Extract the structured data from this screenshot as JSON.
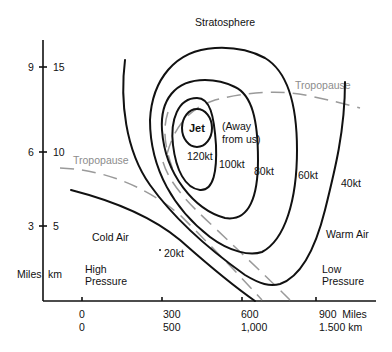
{
  "title": "Stratosphere",
  "y_axis": {
    "unit_miles": "Miles",
    "unit_km": "km",
    "ticks": [
      {
        "miles": "9",
        "km": "15"
      },
      {
        "miles": "6",
        "km": "10"
      },
      {
        "miles": "3",
        "km": "5"
      }
    ]
  },
  "x_axis": {
    "ticks": [
      {
        "miles": "0",
        "km": "0"
      },
      {
        "miles": "300",
        "km": "500"
      },
      {
        "miles": "600",
        "km": "1,000"
      },
      {
        "miles": "900  Miles",
        "km": "1.500 km"
      }
    ]
  },
  "tropopause_labels": [
    "Tropopause",
    "Tropopause"
  ],
  "jet": {
    "label": "Jet",
    "note_line1": "(Away",
    "note_line2": "from us)"
  },
  "isotachs": [
    "120kt",
    "100kt",
    "80kt",
    "60kt",
    "40kt",
    "20kt"
  ],
  "regions": {
    "cold_air": "Cold Air",
    "warm_air": "Warm Air",
    "high_pressure_1": "High",
    "high_pressure_2": "Pressure",
    "low_pressure_1": "Low",
    "low_pressure_2": "Pressure"
  }
}
